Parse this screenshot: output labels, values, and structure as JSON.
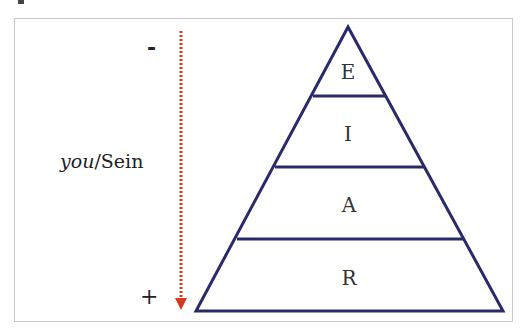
{
  "diagram": {
    "type": "pyramid",
    "axis": {
      "top_label": "-",
      "bottom_label": "+",
      "label_italic": "you",
      "label_rest": "/Sein",
      "arrow_color": "#d9381e",
      "arrow_direction": "down"
    },
    "layers": [
      {
        "label": "E",
        "level": 1
      },
      {
        "label": "I",
        "level": 2
      },
      {
        "label": "A",
        "level": 3
      },
      {
        "label": "R",
        "level": 4
      }
    ],
    "line_color": "#2a2a6a"
  }
}
